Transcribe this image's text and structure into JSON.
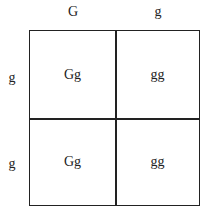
{
  "columns": [
    "G",
    "g"
  ],
  "rows": [
    "g",
    "g"
  ],
  "cells": [
    [
      "Gg",
      "gg"
    ],
    [
      "Gg",
      "gg"
    ]
  ]
}
